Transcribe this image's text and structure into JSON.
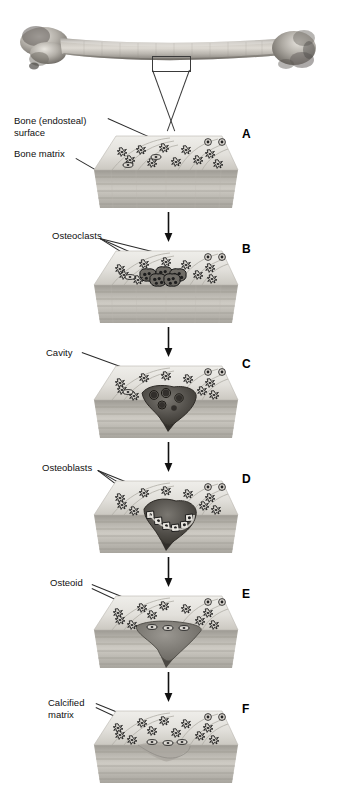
{
  "figure": {
    "title_present": false,
    "background_color": "#ffffff",
    "ink_color": "#101010"
  },
  "overview": {
    "specimen_name": "long-bone-humerus-photograph",
    "callout_box_label": "",
    "callout_note": "rectangle marking sampled region on bone shaft"
  },
  "labels": [
    {
      "id": "bone-endosteal-surface",
      "text": "Bone (endosteal)\nsurface",
      "x": 14,
      "y": 115
    },
    {
      "id": "bone-matrix",
      "text": "Bone matrix",
      "x": 14,
      "y": 148
    },
    {
      "id": "osteoclasts",
      "text": "Osteoclasts",
      "x": 52,
      "y": 230
    },
    {
      "id": "cavity",
      "text": "Cavity",
      "x": 46,
      "y": 347
    },
    {
      "id": "osteoblasts",
      "text": "Osteoblasts",
      "x": 42,
      "y": 462
    },
    {
      "id": "osteoid",
      "text": "Osteoid",
      "x": 50,
      "y": 577
    },
    {
      "id": "calcified-matrix",
      "text": "Calcified\nmatrix",
      "x": 48,
      "y": 697
    }
  ],
  "panels": [
    {
      "letter": "A",
      "stage": "resting-bone-surface",
      "block_top": 130,
      "letter_x": 242,
      "letter_y": 127
    },
    {
      "letter": "B",
      "stage": "osteoclast-recruitment",
      "block_top": 245,
      "letter_x": 242,
      "letter_y": 242
    },
    {
      "letter": "C",
      "stage": "resorption-cavity",
      "block_top": 360,
      "letter_x": 242,
      "letter_y": 357
    },
    {
      "letter": "D",
      "stage": "osteoblast-recruitment",
      "block_top": 475,
      "letter_x": 242,
      "letter_y": 472
    },
    {
      "letter": "E",
      "stage": "osteoid-deposition",
      "block_top": 590,
      "letter_x": 242,
      "letter_y": 587
    },
    {
      "letter": "F",
      "stage": "calcified-matrix-completed",
      "block_top": 705,
      "letter_x": 242,
      "letter_y": 702
    }
  ],
  "arrows": [
    {
      "id": "arrow-a-b",
      "x": 163,
      "y": 212,
      "length": 30
    },
    {
      "id": "arrow-b-c",
      "x": 163,
      "y": 327,
      "length": 30
    },
    {
      "id": "arrow-c-d",
      "x": 163,
      "y": 442,
      "length": 30
    },
    {
      "id": "arrow-d-e",
      "x": 163,
      "y": 557,
      "length": 30
    },
    {
      "id": "arrow-e-f",
      "x": 163,
      "y": 672,
      "length": 30
    }
  ],
  "palette": {
    "bone_surface_light": "#e3e1dc",
    "bone_surface_mid": "#cfccc5",
    "matrix_band_dark": "#a5a29b",
    "matrix_band_light": "#c9c6bf",
    "cell_outline": "#1d1d1d",
    "cavity_dark": "#5d5a55",
    "osteoid_grey": "#7b7872",
    "leader_line": "#2a2a2a",
    "bone_photo_grey": "#9b9790"
  }
}
